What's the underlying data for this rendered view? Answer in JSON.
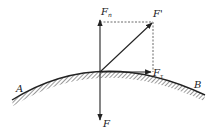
{
  "diagram": {
    "labels": {
      "normal_force": "F",
      "normal_force_sub": "n",
      "resultant_force": "F'",
      "tangential_force": "F",
      "tangential_force_sub": "τ",
      "applied_force": "F",
      "point_a": "A",
      "point_b": "B"
    },
    "colors": {
      "line": "#222222",
      "dashed": "#444444",
      "background": "#ffffff"
    }
  }
}
